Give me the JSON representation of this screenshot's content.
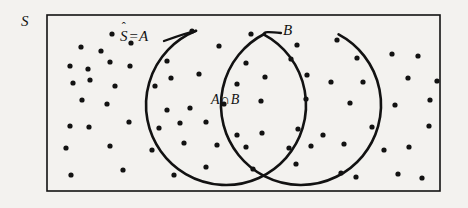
{
  "figure": {
    "type": "venn-diagram",
    "background_color": "#f3f2ef",
    "ink_color": "#121212"
  },
  "labels": {
    "sample_space": "S",
    "set_a_base": "S",
    "set_a_hat": "ˆ",
    "set_a_equals": "=",
    "set_a_name": "A",
    "set_b": "B",
    "intersection_left": "A",
    "intersection_symbol": "∩",
    "intersection_right": "B"
  },
  "geometry": {
    "rect": {
      "x": 47,
      "y": 15,
      "width": 393,
      "height": 176,
      "stroke_width": 1.6
    },
    "circle_a": {
      "cx": 226,
      "cy": 105,
      "r": 80,
      "stroke_width": 2.6
    },
    "circle_b": {
      "cx": 301,
      "cy": 105,
      "r": 80,
      "stroke_width": 2.6
    },
    "dot_radius": 2.6
  },
  "dots": [
    [
      112,
      34
    ],
    [
      192,
      31
    ],
    [
      251,
      34
    ],
    [
      81,
      47
    ],
    [
      101,
      51
    ],
    [
      131,
      43
    ],
    [
      219,
      46
    ],
    [
      297,
      45
    ],
    [
      337,
      40
    ],
    [
      70,
      66
    ],
    [
      88,
      69
    ],
    [
      110,
      62
    ],
    [
      130,
      66
    ],
    [
      167,
      61
    ],
    [
      246,
      63
    ],
    [
      291,
      59
    ],
    [
      357,
      58
    ],
    [
      392,
      54
    ],
    [
      418,
      56
    ],
    [
      73,
      83
    ],
    [
      90,
      80
    ],
    [
      115,
      86
    ],
    [
      155,
      86
    ],
    [
      171,
      78
    ],
    [
      199,
      74
    ],
    [
      237,
      84
    ],
    [
      265,
      77
    ],
    [
      307,
      75
    ],
    [
      331,
      82
    ],
    [
      363,
      82
    ],
    [
      408,
      78
    ],
    [
      437,
      81
    ],
    [
      82,
      100
    ],
    [
      107,
      104
    ],
    [
      167,
      110
    ],
    [
      190,
      108
    ],
    [
      224,
      104
    ],
    [
      261,
      101
    ],
    [
      306,
      99
    ],
    [
      350,
      103
    ],
    [
      395,
      105
    ],
    [
      430,
      100
    ],
    [
      70,
      126
    ],
    [
      89,
      127
    ],
    [
      129,
      122
    ],
    [
      159,
      128
    ],
    [
      180,
      123
    ],
    [
      206,
      122
    ],
    [
      237,
      135
    ],
    [
      262,
      133
    ],
    [
      298,
      129
    ],
    [
      323,
      135
    ],
    [
      372,
      127
    ],
    [
      429,
      126
    ],
    [
      66,
      148
    ],
    [
      110,
      146
    ],
    [
      152,
      150
    ],
    [
      184,
      143
    ],
    [
      217,
      145
    ],
    [
      246,
      147
    ],
    [
      289,
      148
    ],
    [
      311,
      146
    ],
    [
      344,
      144
    ],
    [
      384,
      150
    ],
    [
      409,
      147
    ],
    [
      71,
      175
    ],
    [
      123,
      170
    ],
    [
      174,
      175
    ],
    [
      206,
      167
    ],
    [
      253,
      169
    ],
    [
      296,
      164
    ],
    [
      341,
      173
    ],
    [
      356,
      177
    ],
    [
      398,
      174
    ],
    [
      422,
      178
    ]
  ]
}
